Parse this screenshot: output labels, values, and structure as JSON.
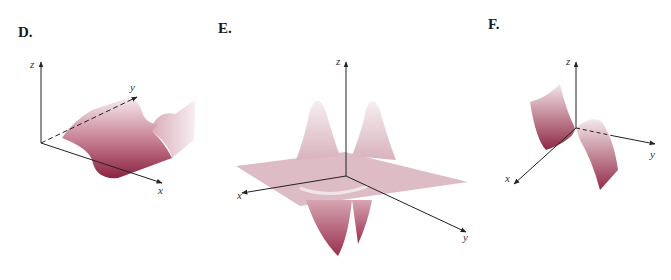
{
  "figure": {
    "panels": [
      {
        "label": "D.",
        "description": "Surface shaped as a trough/valley running parallel to the y-axis, rising into ridges on either side",
        "axes": {
          "x": "x",
          "y": "y",
          "z": "z"
        }
      },
      {
        "label": "E.",
        "description": "Flat plane with two tall peaks behind the z-axis and two deep wells in front of it",
        "axes": {
          "x": "x",
          "y": "y",
          "z": "z"
        }
      },
      {
        "label": "F.",
        "description": "Cubic-like S-shaped sheet extended along the x direction, rising on one side and falling on the other",
        "axes": {
          "x": "x",
          "y": "y",
          "z": "z"
        }
      }
    ],
    "colors": {
      "surface_dark": "#8b2340",
      "surface_mid": "#c0788c",
      "surface_light": "#f3e6ea",
      "plane": "#d9b4bf",
      "axis": "#222222"
    }
  }
}
